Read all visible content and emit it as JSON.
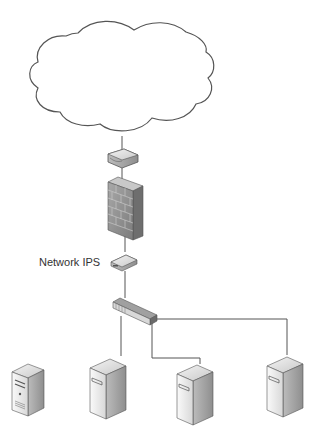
{
  "diagram": {
    "title": "",
    "nodes": [
      {
        "id": "internet",
        "type": "cloud",
        "label": ""
      },
      {
        "id": "router",
        "type": "router",
        "label": ""
      },
      {
        "id": "firewall",
        "type": "firewall",
        "label": ""
      },
      {
        "id": "ips",
        "type": "network-ips",
        "label": "Network IPS"
      },
      {
        "id": "switch",
        "type": "switch",
        "label": ""
      },
      {
        "id": "server1",
        "type": "server",
        "label": ""
      },
      {
        "id": "server2",
        "type": "server",
        "label": ""
      },
      {
        "id": "server3",
        "type": "server",
        "label": ""
      },
      {
        "id": "server4",
        "type": "server",
        "label": ""
      }
    ],
    "edges": [
      {
        "from": "internet",
        "to": "router"
      },
      {
        "from": "router",
        "to": "firewall"
      },
      {
        "from": "firewall",
        "to": "ips"
      },
      {
        "from": "ips",
        "to": "switch"
      },
      {
        "from": "switch",
        "to": "server2"
      },
      {
        "from": "switch",
        "to": "server3"
      },
      {
        "from": "switch",
        "to": "server4"
      }
    ],
    "colors": {
      "line": "#555555",
      "device_light": "#e6e6e6",
      "device_mid": "#bdbdbd",
      "device_dark": "#8a8a8a",
      "firewall": "#9a9a9a",
      "background": "#ffffff"
    }
  },
  "labels": {
    "ips_label": "Network IPS"
  }
}
